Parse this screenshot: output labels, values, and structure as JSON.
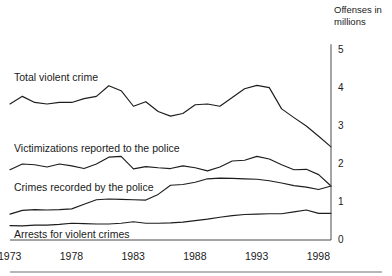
{
  "chart_data": {
    "type": "line",
    "title": "",
    "subtitle": "",
    "xlabel": "",
    "ylabel": "Offenses in millions",
    "axis_title_line1": "Offenses in",
    "axis_title_line2": "millions",
    "xlim": [
      1973,
      1999
    ],
    "ylim": [
      0,
      5
    ],
    "yticks": [
      "5",
      "4",
      "3",
      "2",
      "1",
      "0"
    ],
    "ytick_values": [
      5,
      4,
      3,
      2,
      1,
      0
    ],
    "xticks": [
      "1973",
      "1978",
      "1983",
      "1988",
      "1993",
      "1998"
    ],
    "xtick_values": [
      1973,
      1978,
      1983,
      1988,
      1993,
      1998
    ],
    "grid": false,
    "legend_position": "inline-labels",
    "x": [
      1973,
      1974,
      1975,
      1976,
      1977,
      1978,
      1979,
      1980,
      1981,
      1982,
      1983,
      1984,
      1985,
      1986,
      1987,
      1988,
      1989,
      1990,
      1991,
      1992,
      1993,
      1994,
      1995,
      1996,
      1997,
      1998,
      1999
    ],
    "series": [
      {
        "name": "Total violent crime",
        "label": "Total violent crime",
        "label_x_px": 14,
        "label_y_px": 72,
        "values": [
          3.58,
          3.78,
          3.62,
          3.58,
          3.62,
          3.62,
          3.72,
          3.78,
          4.06,
          3.93,
          3.52,
          3.64,
          3.38,
          3.26,
          3.33,
          3.56,
          3.58,
          3.52,
          3.75,
          3.98,
          4.07,
          4.01,
          3.45,
          3.22,
          3.0,
          2.73,
          2.45
        ]
      },
      {
        "name": "Victimizations reported to the police",
        "label": "Victimizations reported to the police",
        "label_x_px": 14,
        "label_y_px": 143,
        "values": [
          1.85,
          2.0,
          1.98,
          1.92,
          2.0,
          1.95,
          1.88,
          2.0,
          2.18,
          2.2,
          1.87,
          1.93,
          1.9,
          1.88,
          1.95,
          1.9,
          1.82,
          1.92,
          2.08,
          2.1,
          2.2,
          2.13,
          1.98,
          1.85,
          1.86,
          1.72,
          1.42
        ]
      },
      {
        "name": "Crimes recorded by the police",
        "label": "Crimes recorded by the police",
        "label_x_px": 14,
        "label_y_px": 182,
        "values": [
          0.68,
          0.78,
          0.8,
          0.79,
          0.8,
          0.82,
          0.94,
          1.06,
          1.08,
          1.07,
          1.06,
          1.05,
          1.2,
          1.44,
          1.46,
          1.52,
          1.61,
          1.63,
          1.62,
          1.61,
          1.6,
          1.56,
          1.5,
          1.43,
          1.39,
          1.33,
          1.42
        ]
      },
      {
        "name": "Arrests for violent crimes",
        "label": "Arrests for violent crimes",
        "label_x_px": 14,
        "label_y_px": 229,
        "values": [
          0.38,
          0.37,
          0.39,
          0.39,
          0.41,
          0.44,
          0.43,
          0.42,
          0.42,
          0.44,
          0.48,
          0.44,
          0.44,
          0.45,
          0.47,
          0.51,
          0.55,
          0.6,
          0.64,
          0.67,
          0.68,
          0.69,
          0.69,
          0.74,
          0.79,
          0.7,
          0.7
        ]
      }
    ]
  }
}
